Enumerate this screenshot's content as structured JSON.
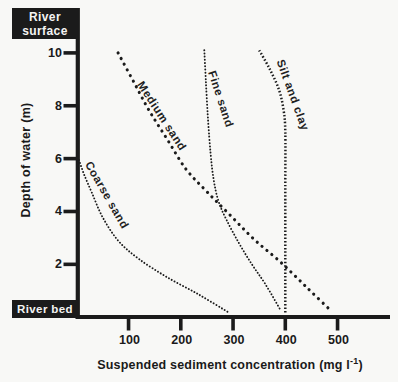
{
  "boxes": {
    "surface_line1": "River",
    "surface_line2": "surface",
    "bed": "River bed"
  },
  "axes": {
    "y_label": "Depth of water (m)",
    "x_label_pre": "Suspended sediment concentration (mg l",
    "x_label_sup": "-1",
    "x_label_post": ")",
    "y_tick_labels": [
      "2",
      "4",
      "6",
      "8",
      "10"
    ],
    "x_tick_labels": [
      "100",
      "200",
      "300",
      "400",
      "500"
    ]
  },
  "chart_data": {
    "type": "line",
    "title": "",
    "xlabel": "Suspended sediment concentration (mg l⁻¹)",
    "ylabel": "Depth of water (m)",
    "xlim": [
      0,
      600
    ],
    "ylim": [
      0,
      11.7
    ],
    "x_ticks": [
      100,
      200,
      300,
      400,
      500
    ],
    "y_ticks": [
      2,
      4,
      6,
      8,
      10
    ],
    "grid": false,
    "legend": "labels placed along curves",
    "line_style": "dotted",
    "series": [
      {
        "name": "Coarse sand",
        "dot_style": "fine",
        "points": [
          [
            5,
            5.95
          ],
          [
            15,
            5.4
          ],
          [
            30,
            4.7
          ],
          [
            50,
            3.8
          ],
          [
            80,
            2.9
          ],
          [
            120,
            2.2
          ],
          [
            175,
            1.5
          ],
          [
            235,
            0.85
          ],
          [
            290,
            0.2
          ]
        ]
      },
      {
        "name": "Medium sand",
        "dot_style": "large",
        "points": [
          [
            80,
            10.0
          ],
          [
            110,
            8.9
          ],
          [
            140,
            7.8
          ],
          [
            175,
            6.7
          ],
          [
            210,
            5.6
          ],
          [
            250,
            4.75
          ],
          [
            295,
            3.85
          ],
          [
            340,
            2.95
          ],
          [
            390,
            2.1
          ],
          [
            440,
            1.15
          ],
          [
            487,
            0.25
          ]
        ]
      },
      {
        "name": "Fine sand",
        "dot_style": "fine",
        "points": [
          [
            245,
            10.1
          ],
          [
            248,
            8.9
          ],
          [
            252,
            7.5
          ],
          [
            257,
            6.2
          ],
          [
            263,
            5.2
          ],
          [
            272,
            4.4
          ],
          [
            287,
            3.7
          ],
          [
            310,
            2.85
          ],
          [
            336,
            2.0
          ],
          [
            362,
            1.25
          ],
          [
            390,
            0.3
          ]
        ]
      },
      {
        "name": "Silt and clay",
        "dot_style": "square",
        "points": [
          [
            350,
            10.1
          ],
          [
            370,
            9.4
          ],
          [
            388,
            8.6
          ],
          [
            397,
            7.8
          ],
          [
            400,
            7.0
          ],
          [
            400,
            5.0
          ],
          [
            400,
            2.5
          ],
          [
            400,
            0.1
          ]
        ]
      }
    ],
    "annotations": [
      {
        "text": "River surface",
        "position": "top-left, above y-axis"
      },
      {
        "text": "River bed",
        "position": "bottom-left, at x-axis"
      }
    ]
  }
}
